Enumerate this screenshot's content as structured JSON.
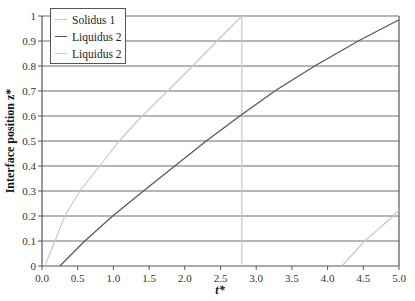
{
  "chart_data": {
    "type": "line",
    "title": "",
    "xlabel": "t*",
    "ylabel": "Interface position z*",
    "xlim": [
      0.0,
      5.0
    ],
    "ylim": [
      0,
      1
    ],
    "x_ticks": [
      "0.0",
      "0.5",
      "1.0",
      "1.5",
      "2.0",
      "2.5",
      "3.0",
      "3.5",
      "4.0",
      "4.5",
      "5.0"
    ],
    "y_ticks": [
      "0",
      "0.1",
      "0.2",
      "0.3",
      "0.4",
      "0.5",
      "0.6",
      "0.7",
      "0.8",
      "0.9",
      "1"
    ],
    "grid": {
      "horizontal": true,
      "vertical": false
    },
    "legend_position": "upper-left",
    "series": [
      {
        "name": "Solidus 1",
        "color": "#c8c8c8",
        "x": [
          0.04,
          0.18,
          0.32,
          0.53,
          0.81,
          1.08,
          1.4,
          1.76,
          2.11,
          2.45,
          2.8,
          2.8
        ],
        "y": [
          0.0,
          0.1,
          0.2,
          0.3,
          0.4,
          0.5,
          0.6,
          0.7,
          0.8,
          0.9,
          1.0,
          0.0
        ]
      },
      {
        "name": "Liquidus 2",
        "color": "#555555",
        "x": [
          0.25,
          0.6,
          0.99,
          1.42,
          1.86,
          2.3,
          2.77,
          3.26,
          3.82,
          4.43,
          5.0
        ],
        "y": [
          0.0,
          0.1,
          0.2,
          0.3,
          0.4,
          0.5,
          0.6,
          0.7,
          0.8,
          0.9,
          0.985
        ]
      },
      {
        "name": "Liquidus 2",
        "color": "#c8c8c8",
        "x": [
          4.2,
          4.52,
          4.92,
          5.0
        ],
        "y": [
          0.0,
          0.1,
          0.2,
          0.225
        ]
      }
    ]
  },
  "legend": {
    "items": [
      {
        "label": "Solidus 1",
        "color": "#c8c8c8"
      },
      {
        "label": "Liquidus 2",
        "color": "#555555"
      },
      {
        "label": "Liquidus 2",
        "color": "#c8c8c8"
      }
    ]
  },
  "axes": {
    "x_title": "t*",
    "y_title": "Interface position z*"
  }
}
